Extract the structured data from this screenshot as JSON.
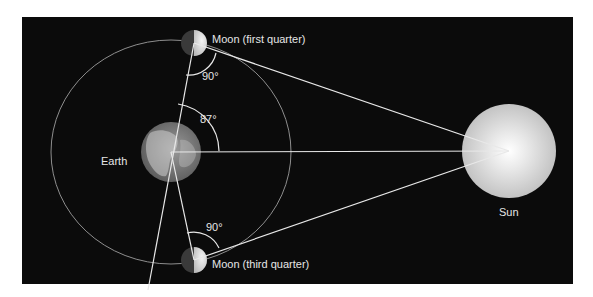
{
  "diagram": {
    "type": "astronomy-geometry",
    "background_color": "#0b0b0b",
    "line_color": "#e8e8e8",
    "orbit_color": "#9a9a9a",
    "labels": {
      "earth": "Earth",
      "sun": "Sun",
      "moon_first": "Moon (first quarter)",
      "moon_third": "Moon (third quarter)",
      "angle_top": "90°",
      "angle_center": "87°",
      "angle_bottom": "90°"
    },
    "angles": {
      "moon_first_quarter_deg": 90,
      "earth_moon_sun_deg": 87,
      "moon_third_quarter_deg": 90
    }
  }
}
